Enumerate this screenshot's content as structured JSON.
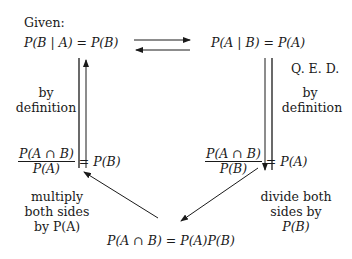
{
  "given_label": "Given:",
  "top_left": "P(B | A) = P(B)",
  "top_right": "P(A | B) = P(A)",
  "qed": "Q. E. D.",
  "left_edge": {
    "line1": "by",
    "line2": "definition"
  },
  "right_edge": {
    "line1": "by",
    "line2": "definition"
  },
  "mid_left": {
    "numerator": "P(A ∩ B)",
    "denominator": "P(A)",
    "rhs": "= P(B)"
  },
  "mid_right": {
    "numerator": "P(A ∩ B)",
    "denominator": "P(B)",
    "rhs": "= P(A)"
  },
  "bottom_left_label": {
    "line1": "multiply",
    "line2": "both sides",
    "line3": "by P(A)"
  },
  "bottom_right_label": {
    "line1": "divide both",
    "line2": "sides by",
    "line3": "P(B)"
  },
  "bottom": "P(A ∩ B) = P(A)P(B)"
}
